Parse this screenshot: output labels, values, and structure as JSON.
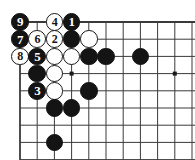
{
  "figure": {
    "kind": "go-board-diagram",
    "title": "",
    "board_region": {
      "columns": 10,
      "rows": 8,
      "origin_x": 20,
      "origin_y": 22,
      "spacing": 17.2
    },
    "colors": {
      "background": "#ffffff",
      "grid_line": "#3a3a3a",
      "black_stone": "#141414",
      "white_stone": "#ffffff",
      "white_stone_outline": "#181818",
      "black_label_text": "#ffffff",
      "white_label_text": "#141414",
      "star_point": "#1a1a1a"
    },
    "star_points": [
      {
        "name": "star-point-upper-left",
        "col": 3,
        "row": 3
      },
      {
        "name": "star-point-upper-right",
        "col": 9,
        "row": 3
      }
    ],
    "stones": [
      {
        "id": "stone-b9",
        "color": "black",
        "label": "9",
        "col": 0,
        "row": 0
      },
      {
        "id": "stone-w4",
        "color": "white",
        "label": "4",
        "col": 2,
        "row": 0
      },
      {
        "id": "stone-b1",
        "color": "black",
        "label": "1",
        "col": 3,
        "row": 0
      },
      {
        "id": "stone-b7",
        "color": "black",
        "label": "7",
        "col": 0,
        "row": 1
      },
      {
        "id": "stone-w6",
        "color": "white",
        "label": "6",
        "col": 1,
        "row": 1
      },
      {
        "id": "stone-w2",
        "color": "white",
        "label": "2",
        "col": 2,
        "row": 1
      },
      {
        "id": "stone-b-c3r1",
        "color": "black",
        "label": "",
        "col": 3,
        "row": 1
      },
      {
        "id": "stone-w-c4r1",
        "color": "white",
        "label": "",
        "col": 4,
        "row": 1
      },
      {
        "id": "stone-w8",
        "color": "white",
        "label": "8",
        "col": 0,
        "row": 2
      },
      {
        "id": "stone-b5",
        "color": "black",
        "label": "5",
        "col": 1,
        "row": 2
      },
      {
        "id": "stone-w-c2r2",
        "color": "white",
        "label": "",
        "col": 2,
        "row": 2
      },
      {
        "id": "stone-w-c3r2",
        "color": "white",
        "label": "",
        "col": 3,
        "row": 2
      },
      {
        "id": "stone-b-c4r2",
        "color": "black",
        "label": "",
        "col": 4,
        "row": 2
      },
      {
        "id": "stone-b-c5r2",
        "color": "black",
        "label": "",
        "col": 5,
        "row": 2
      },
      {
        "id": "stone-b-c7r2",
        "color": "black",
        "label": "",
        "col": 7,
        "row": 2
      },
      {
        "id": "stone-b-c1r3",
        "color": "black",
        "label": "",
        "col": 1,
        "row": 3
      },
      {
        "id": "stone-w-c2r3",
        "color": "white",
        "label": "",
        "col": 2,
        "row": 3
      },
      {
        "id": "stone-b3",
        "color": "black",
        "label": "3",
        "col": 1,
        "row": 4
      },
      {
        "id": "stone-w-c2r4",
        "color": "white",
        "label": "",
        "col": 2,
        "row": 4
      },
      {
        "id": "stone-b-c4r4",
        "color": "black",
        "label": "",
        "col": 4,
        "row": 4
      },
      {
        "id": "stone-b-c2r5",
        "color": "black",
        "label": "",
        "col": 2,
        "row": 5
      },
      {
        "id": "stone-b-c3r5",
        "color": "black",
        "label": "",
        "col": 3,
        "row": 5
      },
      {
        "id": "stone-b-c2r7",
        "color": "black",
        "label": "",
        "col": 2,
        "row": 7
      }
    ],
    "move_sequence": [
      {
        "number": "1",
        "color": "black"
      },
      {
        "number": "2",
        "color": "white"
      },
      {
        "number": "3",
        "color": "black"
      },
      {
        "number": "4",
        "color": "white"
      },
      {
        "number": "5",
        "color": "black"
      },
      {
        "number": "6",
        "color": "white"
      },
      {
        "number": "7",
        "color": "black"
      },
      {
        "number": "8",
        "color": "white"
      },
      {
        "number": "9",
        "color": "black"
      }
    ]
  }
}
